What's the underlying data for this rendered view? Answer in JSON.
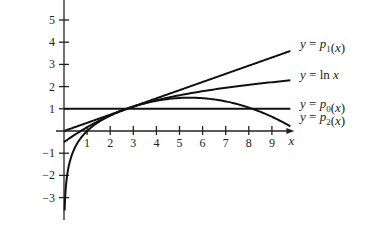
{
  "chart_data": {
    "type": "line",
    "title": "",
    "xlabel": "x",
    "ylabel": "",
    "x_ticks": [
      1,
      2,
      3,
      4,
      5,
      6,
      7,
      8,
      9
    ],
    "y_ticks": [
      5,
      4,
      3,
      2,
      1,
      -1,
      -2,
      -3
    ],
    "xlim": [
      0,
      9.8
    ],
    "ylim": [
      -3.8,
      5.5
    ],
    "grid": false,
    "legend_position": "right (inline labels)",
    "series": [
      {
        "name": "y = p1(x)",
        "label_main": "y = p",
        "label_sub": "1",
        "label_tail": "(x)",
        "kind": "tangent line at x=e",
        "expression": "x/e",
        "x": [
          0,
          9.8
        ],
        "values": [
          0,
          3.6
        ]
      },
      {
        "name": "y = ln x",
        "label_main": "y = ln x",
        "label_sub": "",
        "label_tail": "",
        "kind": "natural log",
        "expression": "ln(x)",
        "x": [
          0.03,
          0.1,
          0.3,
          0.6,
          1,
          2,
          3,
          5,
          7,
          9.8
        ],
        "values": [
          -3.5,
          -2.3,
          -1.2,
          -0.51,
          0,
          0.69,
          1.1,
          1.61,
          1.95,
          2.28
        ]
      },
      {
        "name": "y = p0(x)",
        "label_main": "y = p",
        "label_sub": "0",
        "label_tail": "(x)",
        "kind": "constant",
        "expression": "1",
        "x": [
          0,
          9.8
        ],
        "values": [
          1,
          1
        ]
      },
      {
        "name": "y = p2(x)",
        "label_main": "y = p",
        "label_sub": "2",
        "label_tail": "(x)",
        "kind": "quadratic Taylor at x=e",
        "expression": "1 + (x-e)/e - (x-e)^2/(2e^2)",
        "x": [
          0,
          1,
          2,
          2.718,
          4,
          5.44,
          7,
          8.15,
          9.8
        ],
        "values": [
          -0.5,
          0.2,
          0.7,
          1,
          1.36,
          1.5,
          1.33,
          1.0,
          0.0
        ]
      }
    ]
  }
}
